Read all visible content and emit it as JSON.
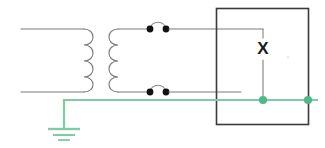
{
  "diagram": {
    "labels": {
      "x_terminal": "X"
    },
    "colors": {
      "wire": "#6e6e6e",
      "wire_dark": "#4a4a4a",
      "box_border": "#3a3a3a",
      "ground_green": "#7fcca4",
      "contact_dot": "#111111",
      "background": "#ffffff"
    },
    "components": [
      {
        "name": "primary-coil",
        "type": "inductor",
        "turns": 4,
        "side": "left",
        "orientation": "vertical"
      },
      {
        "name": "secondary-coil",
        "type": "inductor",
        "turns": 4,
        "side": "right",
        "orientation": "vertical"
      },
      {
        "name": "switch-top",
        "type": "contact-pair",
        "state": "closed",
        "position": "top"
      },
      {
        "name": "switch-bottom",
        "type": "contact-pair",
        "state": "closed",
        "position": "bottom"
      },
      {
        "name": "device-box",
        "type": "enclosure",
        "label": "X"
      },
      {
        "name": "ground-symbol",
        "type": "earth-ground",
        "bars": 3
      },
      {
        "name": "junction-dot-inner",
        "type": "node",
        "color": "#4fb987"
      },
      {
        "name": "junction-dot-edge",
        "type": "node",
        "color": "#4fb987"
      }
    ]
  }
}
